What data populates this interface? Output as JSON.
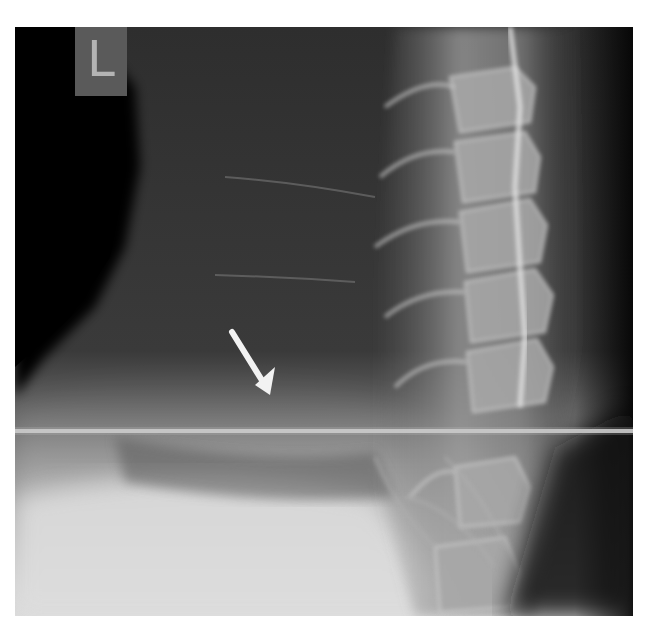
{
  "image": {
    "type": "radiograph",
    "view": "lateral cervical spine X-ray",
    "side_marker": "L",
    "annotation": "white arrow pointing to soft tissue anterior to lower cervical spine",
    "colors": {
      "background": "#ffffff",
      "film_dark": "#0c0c0c",
      "film_mid": "#4a4a4a",
      "bone_light": "#c8c8c8",
      "marker_box": "#5a5a5a",
      "marker_text": "#b4b4b4",
      "arrow": "#f2f2f2"
    }
  }
}
